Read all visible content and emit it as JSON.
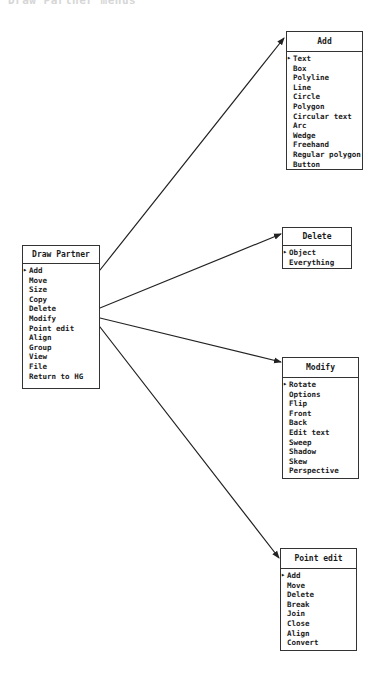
{
  "caption_fragment": "Draw Partner menus",
  "menus": {
    "main": {
      "title": "Draw Partner",
      "items": [
        "Add",
        "Move",
        "Size",
        "Copy",
        "Delete",
        "Modify",
        "Point edit",
        "Align",
        "Group",
        "View",
        "File",
        "Return to HG"
      ],
      "selected": 0
    },
    "add": {
      "title": "Add",
      "items": [
        "Text",
        "Box",
        "Polyline",
        "Line",
        "Circle",
        "Polygon",
        "Circular text",
        "Arc",
        "Wedge",
        "Freehand",
        "Regular polygon",
        "Button"
      ],
      "selected": 0
    },
    "delete": {
      "title": "Delete",
      "items": [
        "Object",
        "Everything"
      ],
      "selected": 0
    },
    "modify": {
      "title": "Modify",
      "items": [
        "Rotate",
        "Options",
        "Flip",
        "Front",
        "Back",
        "Edit text",
        "Sweep",
        "Shadow",
        "Skew",
        "Perspective"
      ],
      "selected": 0
    },
    "point_edit": {
      "title": "Point edit",
      "items": [
        "Add",
        "Move",
        "Delete",
        "Break",
        "Join",
        "Close",
        "Align",
        "Convert"
      ],
      "selected": 0
    }
  },
  "connectors": [
    {
      "from": "Add",
      "to": "Add menu"
    },
    {
      "from": "Delete",
      "to": "Delete menu"
    },
    {
      "from": "Modify",
      "to": "Modify menu"
    },
    {
      "from": "Point edit",
      "to": "Point edit menu"
    }
  ]
}
